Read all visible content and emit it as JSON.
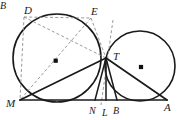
{
  "figure": {
    "kind": "geometry-diagram",
    "background_color": "#ffffff",
    "stroke_color": "#1a1a1a",
    "dashed_color": "#8a8a8a",
    "width": 178,
    "height": 120
  },
  "points": {
    "partial_left": {
      "label": "B",
      "x": 2,
      "y": 9
    },
    "D": {
      "label": "D",
      "x": 24,
      "y": 14,
      "px": 31,
      "py": 22
    },
    "E": {
      "label": "E",
      "x": 91,
      "y": 15,
      "px": 88,
      "py": 22
    },
    "T": {
      "label": "T",
      "x": 113,
      "y": 60,
      "px": 106,
      "py": 58
    },
    "M": {
      "label": "M",
      "x": 8,
      "y": 106,
      "px": 20,
      "py": 100
    },
    "N": {
      "label": "N",
      "x": 91,
      "y": 114,
      "px": 95,
      "py": 100
    },
    "L": {
      "label": "L",
      "x": 104,
      "y": 116,
      "px": 106,
      "py": 100
    },
    "B": {
      "label": "B",
      "x": 116,
      "y": 114,
      "px": 117,
      "py": 100
    },
    "A": {
      "label": "A",
      "x": 166,
      "y": 110,
      "px": 167,
      "py": 100
    }
  },
  "circles": {
    "left": {
      "name": "left-circle",
      "cx": 57,
      "cy": 58,
      "r": 44,
      "center_dot": {
        "x": 56,
        "y": 61
      }
    },
    "right": {
      "name": "right-circle",
      "cx": 140,
      "cy": 66,
      "r": 35,
      "center_dot": {
        "x": 141,
        "y": 67
      }
    }
  },
  "segments": {
    "solid": [
      {
        "name": "segment-M-A",
        "x1": 20,
        "y1": 100,
        "x2": 167,
        "y2": 100
      },
      {
        "name": "segment-M-T",
        "x1": 20,
        "y1": 100,
        "x2": 106,
        "y2": 58
      },
      {
        "name": "segment-T-A",
        "x1": 106,
        "y1": 58,
        "x2": 167,
        "y2": 100
      },
      {
        "name": "segment-T-N",
        "x1": 106,
        "y1": 58,
        "x2": 95,
        "y2": 100
      },
      {
        "name": "segment-T-L",
        "x1": 106,
        "y1": 58,
        "x2": 106,
        "y2": 100
      },
      {
        "name": "segment-T-B",
        "x1": 106,
        "y1": 58,
        "x2": 117,
        "y2": 100
      }
    ],
    "dashed": [
      {
        "name": "segment-D-M",
        "x1": 24,
        "y1": 17,
        "x2": 20,
        "y2": 100
      },
      {
        "name": "segment-D-E",
        "x1": 24,
        "y1": 17,
        "x2": 91,
        "y2": 18
      },
      {
        "name": "segment-D-T",
        "x1": 24,
        "y1": 17,
        "x2": 106,
        "y2": 58
      },
      {
        "name": "segment-E-M",
        "x1": 91,
        "y1": 18,
        "x2": 20,
        "y2": 100
      },
      {
        "name": "segment-E-T",
        "x1": 91,
        "y1": 18,
        "x2": 106,
        "y2": 58
      },
      {
        "name": "tangent-line-at-T",
        "x1": 113,
        "y1": 20,
        "x2": 101,
        "y2": 105
      }
    ]
  }
}
